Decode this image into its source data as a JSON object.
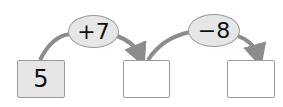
{
  "diagram": {
    "type": "number-operation-chain",
    "start": {
      "value": "5"
    },
    "steps": [
      {
        "operation": "+7",
        "result": ""
      },
      {
        "operation": "−8",
        "result": ""
      }
    ],
    "colors": {
      "box_fill_start": "#e6e6e6",
      "box_fill_empty": "#ffffff",
      "operator_fill": "#e6e6e6",
      "arrow": "#8c8c8c",
      "border": "#9a9a9a"
    }
  }
}
